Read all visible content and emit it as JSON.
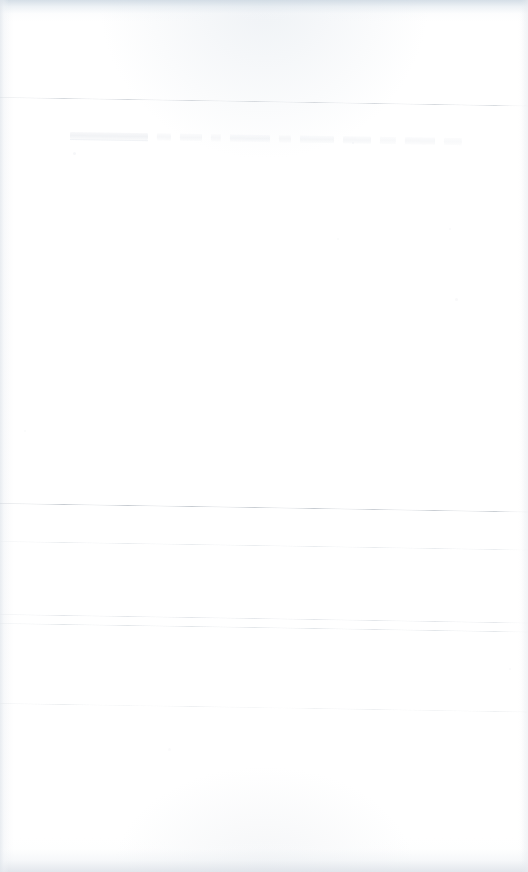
{
  "document": {
    "kind": "scanned-page",
    "title": "Scanned blank page",
    "page_width": 528,
    "page_height": 872,
    "background_color": "#ffffff",
    "content_summary": "Near-blank scanned sheet: five faint skewed horizontal ruled lines, one illegible row of ghosted text near the top, and gray scan-edge shading along the top, bottom and left margins.",
    "legible_text": "",
    "skew_note": "All rules drop about 8 px from left edge to right edge (~0.9 degrees)."
  },
  "edges": {
    "top": {
      "name": "top scan edge",
      "color": "#cdd8e2",
      "height_px": 22
    },
    "bottom": {
      "name": "bottom scan edge",
      "color": "#dbe0e7",
      "height_px": 34
    },
    "left": {
      "name": "left scan edge",
      "color": "#e2e7ed",
      "width_px": 9
    },
    "right": {
      "name": "right scan edge",
      "color": "#e9edf1",
      "width_px": 7
    }
  },
  "rules": [
    {
      "id": "rule-1",
      "top": 97,
      "skew_deg": 0.92,
      "color": "#d3d7dc",
      "opacity": 0.95,
      "thickness": 1,
      "style": "fade-ends"
    },
    {
      "id": "rule-2",
      "top": 503,
      "skew_deg": 0.92,
      "color": "#c6cbd1",
      "opacity": 1.0,
      "thickness": 1,
      "style": "fade-ends"
    },
    {
      "id": "rule-3",
      "top": 541,
      "skew_deg": 0.92,
      "color": "#e8ebee",
      "opacity": 0.95,
      "thickness": 1,
      "style": "fade-ends"
    },
    {
      "id": "rule-4",
      "top": 614,
      "skew_deg": 0.92,
      "color": "#e2e5e9",
      "opacity": 0.95,
      "thickness": 1,
      "style": "fade-ends"
    },
    {
      "id": "rule-5",
      "top": 623,
      "skew_deg": 0.92,
      "color": "#dfe3e7",
      "opacity": 0.9,
      "thickness": 1,
      "style": "fade-ends"
    },
    {
      "id": "rule-6",
      "top": 703,
      "skew_deg": 0.92,
      "color": "#e4e7ea",
      "opacity": 0.9,
      "thickness": 1,
      "style": "broken"
    }
  ],
  "ghost_text_row": {
    "name": "illegible ghosted text line",
    "left": 70,
    "top": 132,
    "skew_deg": 0.9,
    "legible": false,
    "transcription": "",
    "words": [
      {
        "width": 78,
        "opacity": 0.85,
        "underscored": true
      },
      {
        "width": 14,
        "opacity": 0.55
      },
      {
        "width": 22,
        "opacity": 0.6
      },
      {
        "width": 10,
        "opacity": 0.45
      },
      {
        "width": 40,
        "opacity": 0.7
      },
      {
        "width": 12,
        "opacity": 0.5
      },
      {
        "width": 34,
        "opacity": 0.65
      },
      {
        "width": 28,
        "opacity": 0.6
      },
      {
        "width": 16,
        "opacity": 0.45
      },
      {
        "width": 30,
        "opacity": 0.55
      },
      {
        "width": 18,
        "opacity": 0.4
      }
    ]
  },
  "specks": [
    {
      "left": 73,
      "top": 152,
      "size": 3,
      "opacity": 0.35
    },
    {
      "left": 352,
      "top": 142,
      "size": 2,
      "opacity": 0.3
    },
    {
      "left": 449,
      "top": 228,
      "size": 2,
      "opacity": 0.22
    },
    {
      "left": 337,
      "top": 238,
      "size": 2,
      "opacity": 0.2
    },
    {
      "left": 455,
      "top": 298,
      "size": 3,
      "opacity": 0.25
    },
    {
      "left": 168,
      "top": 748,
      "size": 3,
      "opacity": 0.22
    },
    {
      "left": 24,
      "top": 430,
      "size": 2,
      "opacity": 0.2
    },
    {
      "left": 509,
      "top": 668,
      "size": 2,
      "opacity": 0.22
    }
  ]
}
